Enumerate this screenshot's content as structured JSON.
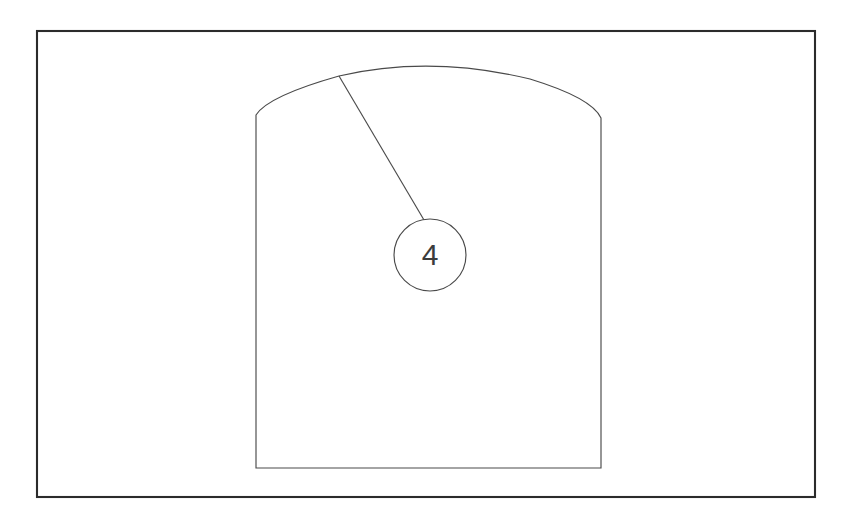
{
  "drawing": {
    "title": "Arch-top panel technical drawing",
    "background_color": "#ffffff",
    "canvas": {
      "width": 852,
      "height": 517
    },
    "frame": {
      "name": "drawing-border",
      "x": 37,
      "y": 31,
      "width": 778,
      "height": 466,
      "stroke_color": "#2b2b2b",
      "stroke_width": 2.1
    },
    "part": {
      "name": "arch-top-panel",
      "stroke_color": "#4a4a4a",
      "stroke_width": 1.15,
      "left_x": 256,
      "right_x": 601,
      "bottom_y": 468,
      "shoulder_left_y": 115,
      "shoulder_right_y": 118,
      "arch_apex_x": 430,
      "arch_apex_y": 60,
      "path": "M 256 468 L 256 115 Q 268 96 339 76 Q 430 55 530 79 Q 592 98 601 118 L 601 468 Z"
    },
    "callout": {
      "name": "balloon-callout-4",
      "label": "4",
      "circle": {
        "center_x": 430,
        "center_y": 255,
        "radius": 36,
        "fill": "#ffffff",
        "stroke_color": "#4a4a4a"
      },
      "leader": {
        "start_x": 339,
        "start_y": 76,
        "end_x": 424,
        "end_y": 220,
        "stroke_color": "#4a4a4a"
      },
      "text_color": "#3c3c3c",
      "font_size_px": 30
    }
  }
}
